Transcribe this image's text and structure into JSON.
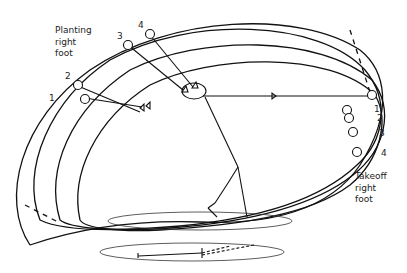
{
  "labels": {
    "planting": [
      "Planting",
      "right",
      "foot"
    ],
    "takeoff": [
      "Takeoff",
      "right",
      "foot"
    ]
  },
  "left_markers": [
    "1",
    "2",
    "3",
    "4"
  ],
  "right_markers": [
    "1",
    "2",
    "3",
    "4"
  ],
  "colors": {
    "stroke": "#111111",
    "background": "#ffffff"
  }
}
